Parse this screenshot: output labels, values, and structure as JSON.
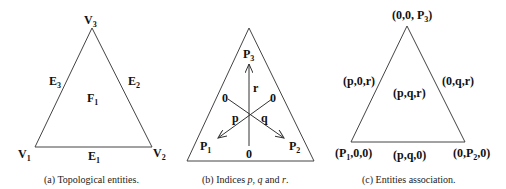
{
  "panels": [
    {
      "id": "a",
      "caption": "(a) Topological entities.",
      "vertices": [
        {
          "name": "V",
          "sub": "1"
        },
        {
          "name": "V",
          "sub": "2"
        },
        {
          "name": "V",
          "sub": "3"
        }
      ],
      "edges": [
        {
          "name": "E",
          "sub": "1"
        },
        {
          "name": "E",
          "sub": "2"
        },
        {
          "name": "E",
          "sub": "3"
        }
      ],
      "face": {
        "name": "F",
        "sub": "1"
      }
    },
    {
      "id": "b",
      "caption_prefix": "(b) Indices ",
      "caption_p": "p",
      "caption_sep1": ", ",
      "caption_q": "q",
      "caption_sep2": " and ",
      "caption_r": "r",
      "caption_end": ".",
      "corners": [
        {
          "name": "P",
          "sub": "1"
        },
        {
          "name": "P",
          "sub": "2"
        },
        {
          "name": "P",
          "sub": "3"
        }
      ],
      "axes": {
        "p": "p",
        "q": "q",
        "r": "r"
      },
      "zero": "0"
    },
    {
      "id": "c",
      "caption": "(c) Entities association.",
      "vertex_labels": {
        "v1_pre": "(P",
        "v1_sub": "1",
        "v1_post": ",0,0)",
        "v2_pre": "(0,P",
        "v2_sub": "2",
        "v2_post": ",0)",
        "v3_pre": "(0,0, P",
        "v3_sub": "3",
        "v3_post": ")"
      },
      "edge_labels": {
        "bottom": "(p,q,0)",
        "left": "(p,0,r)",
        "right": "(0,q,r)"
      },
      "face_label": "(p,q,r)"
    }
  ]
}
